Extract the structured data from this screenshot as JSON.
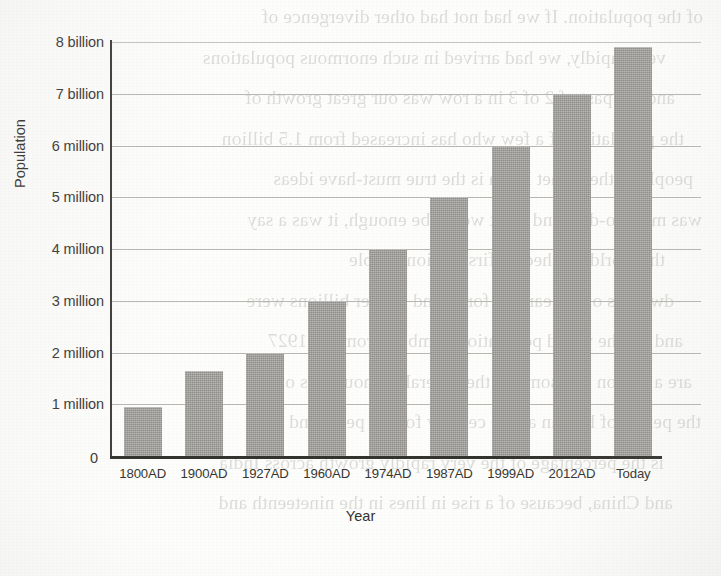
{
  "chart_data": {
    "type": "bar",
    "title": "",
    "xlabel": "Year",
    "ylabel": "Population",
    "categories": [
      "1800AD",
      "1900AD",
      "1927AD",
      "1960AD",
      "1974AD",
      "1987AD",
      "1999AD",
      "2012AD",
      "Today"
    ],
    "values": [
      0.95,
      1.65,
      2.0,
      3.0,
      4.0,
      5.0,
      6.0,
      7.0,
      7.9
    ],
    "ytick_values": [
      1,
      2,
      3,
      4,
      5,
      6,
      7,
      8
    ],
    "ytick_labels": [
      "1 million",
      "2 million",
      "3 million",
      "4 million",
      "5 million",
      "6 million",
      "7 billion",
      "8 billion"
    ],
    "zero_label": "0",
    "ylim": [
      0,
      8
    ],
    "grid": true,
    "legend": false,
    "legend_position": "none",
    "bar_color": "#9c9a96",
    "axis_color": "#35332f",
    "grid_color": "#b9b7b2",
    "text_color": "#37352f"
  },
  "bleed_text": {
    "lines": [
      "of the population. If we had not had other divergence of",
      "very rapidly, we had arrived in such enormous populations",
      "and the past of 2 of 3 in a row was our great growth of",
      "the population of a few who has increased from 1.5 billion",
      "people of the planet Earth is the true must-have ideas",
      "was more to-date and what would be enough, it was a say",
      "the world reached its first billion people",
      "dwellers of the earliest form, and further billions were",
      "and so, the world population numbers from the 1927",
      "are a person and some of the several of thousands of",
      "the period of human as the century for the peak, and the",
      "is the percentage of the very rapidly growth across India",
      "and China, because of a rise in lines in the nineteenth and"
    ]
  }
}
